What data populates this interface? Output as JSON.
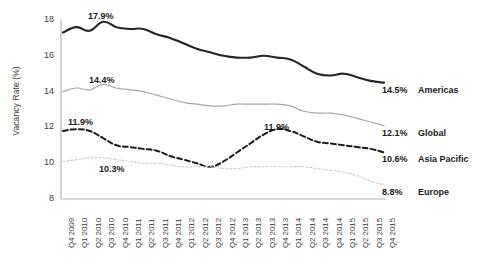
{
  "chart_data": {
    "type": "line",
    "title": "",
    "xlabel": "",
    "ylabel": "Vacancy Rate (%)",
    "ylim": [
      8,
      18
    ],
    "yticks": [
      8,
      10,
      12,
      14,
      16,
      18
    ],
    "grid": false,
    "legend_position": "right-inline",
    "x": [
      "Q4 2009",
      "Q1 2010",
      "Q2 2010",
      "Q3 2010",
      "Q4 2010",
      "Q1 2011",
      "Q2 2011",
      "Q3 2011",
      "Q4 2011",
      "Q1 2012",
      "Q2 2012",
      "Q3 2012",
      "Q4 2012",
      "Q1 2013",
      "Q2 2013",
      "Q3 2013",
      "Q4 2013",
      "Q1 2014",
      "Q2 2014",
      "Q3 2014",
      "Q4 2014",
      "Q1 2015",
      "Q2 2015",
      "Q3 2015",
      "Q4 2015"
    ],
    "series": [
      {
        "name": "Americas",
        "color": "#262626",
        "style": "solid",
        "end_label": "14.5%",
        "annotation": "17.9%",
        "annotation_index": 4,
        "values": [
          17.3,
          17.6,
          17.4,
          17.9,
          17.6,
          17.5,
          17.5,
          17.2,
          17.0,
          16.7,
          16.4,
          16.2,
          16.0,
          15.9,
          15.9,
          16.0,
          15.9,
          15.8,
          15.4,
          15.0,
          14.9,
          15.0,
          14.8,
          14.6,
          14.5
        ]
      },
      {
        "name": "Global",
        "color": "#a6a6a6",
        "style": "solid",
        "end_label": "12.1%",
        "annotation": "14.4%",
        "annotation_index": 4,
        "values": [
          14.0,
          14.2,
          14.1,
          14.4,
          14.2,
          14.1,
          14.0,
          13.8,
          13.6,
          13.4,
          13.3,
          13.2,
          13.2,
          13.3,
          13.3,
          13.3,
          13.3,
          13.2,
          12.9,
          12.8,
          12.8,
          12.7,
          12.5,
          12.3,
          12.1
        ]
      },
      {
        "name": "Asia Pacific",
        "color": "#1a1a1a",
        "style": "dashed",
        "end_label": "10.6%",
        "annotation": "11.9%",
        "annotation_index": 1,
        "annotation2": "11.9%",
        "annotation2_index": 16,
        "values": [
          11.8,
          11.9,
          11.8,
          11.4,
          11.0,
          10.9,
          10.8,
          10.7,
          10.4,
          10.2,
          10.0,
          9.8,
          10.1,
          10.6,
          11.1,
          11.6,
          11.9,
          11.8,
          11.5,
          11.2,
          11.1,
          11.0,
          10.9,
          10.8,
          10.6
        ]
      },
      {
        "name": "Europe",
        "color": "#cccccc",
        "style": "dotted",
        "end_label": "8.8%",
        "annotation": "10.3%",
        "annotation_index": 5,
        "values": [
          10.1,
          10.2,
          10.3,
          10.3,
          10.2,
          10.1,
          10.0,
          10.0,
          9.9,
          9.8,
          9.8,
          9.8,
          9.7,
          9.7,
          9.8,
          9.8,
          9.8,
          9.8,
          9.8,
          9.7,
          9.6,
          9.5,
          9.3,
          9.0,
          8.8
        ]
      }
    ]
  },
  "axis": {
    "y_title": "Vacancy Rate (%)",
    "y_ticks": [
      "18",
      "16",
      "14",
      "12",
      "10",
      "8"
    ],
    "x_ticks": [
      "Q4 2009",
      "Q1 2010",
      "Q2 2010",
      "Q3 2010",
      "Q4 2010",
      "Q1 2011",
      "Q2 2011",
      "Q3 2011",
      "Q4 2011",
      "Q1 2012",
      "Q2 2012",
      "Q3 2012",
      "Q4 2012",
      "Q1 2013",
      "Q2 2013",
      "Q3 2013",
      "Q4 2013",
      "Q1 2014",
      "Q2 2014",
      "Q3 2014",
      "Q4 2014",
      "Q1 2015",
      "Q2 2015",
      "Q3 2015",
      "Q4 2015"
    ]
  },
  "legend": [
    {
      "value": "14.5%",
      "name": "Americas"
    },
    {
      "value": "12.1%",
      "name": "Global"
    },
    {
      "value": "10.6%",
      "name": "Asia Pacific"
    },
    {
      "value": "8.8%",
      "name": "Europe"
    }
  ],
  "annotations": [
    {
      "text": "17.9%"
    },
    {
      "text": "14.4%"
    },
    {
      "text": "11.9%"
    },
    {
      "text": "10.3%"
    },
    {
      "text": "11.9%"
    }
  ]
}
